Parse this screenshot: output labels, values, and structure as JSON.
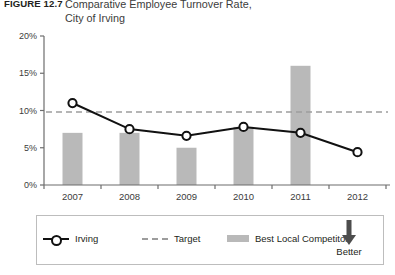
{
  "figure": {
    "label": "FIGURE 12.7",
    "title": "Comparative Employee Turnover Rate,\nCity of Irving"
  },
  "legend": {
    "items": [
      {
        "label": "Irving",
        "icon": "line-with-circle-marker",
        "color": "#111111"
      },
      {
        "label": "Target",
        "icon": "dashed-line",
        "color": "#9d9d9d"
      },
      {
        "label": "Best Local Competitor",
        "icon": "gray-bar",
        "color": "#b9b9b9"
      }
    ],
    "better": {
      "label": "Better",
      "icon": "down-arrow"
    }
  },
  "chart_data": {
    "type": "bar",
    "title": "Comparative Employee Turnover Rate, City of Irving",
    "xlabel": "",
    "ylabel": "",
    "categories": [
      "2007",
      "2008",
      "2009",
      "2010",
      "2011",
      "2012"
    ],
    "ylim": [
      0,
      20
    ],
    "yticks": [
      0,
      5,
      10,
      15,
      20
    ],
    "ytick_labels": [
      "0%",
      "5%",
      "10%",
      "15%",
      "20%"
    ],
    "grid": false,
    "legend_position": "bottom",
    "series": [
      {
        "name": "Best Local Competitor",
        "type": "bar",
        "color": "#b9b9b9",
        "values": [
          7.0,
          7.0,
          5.0,
          7.8,
          16.0,
          null
        ]
      },
      {
        "name": "Irving",
        "type": "line",
        "color": "#111111",
        "marker": "circle",
        "values": [
          11.0,
          7.5,
          6.6,
          7.8,
          7.0,
          4.4
        ]
      },
      {
        "name": "Target",
        "type": "line",
        "style": "dashed",
        "color": "#9d9d9d",
        "constant": 9.8,
        "values": [
          9.8,
          9.8,
          9.8,
          9.8,
          9.8,
          9.8
        ]
      }
    ]
  },
  "axis_geometry": {
    "plot_left": 44,
    "plot_right": 386,
    "plot_top": 6,
    "plot_bottom": 155,
    "bar_width": 20
  }
}
